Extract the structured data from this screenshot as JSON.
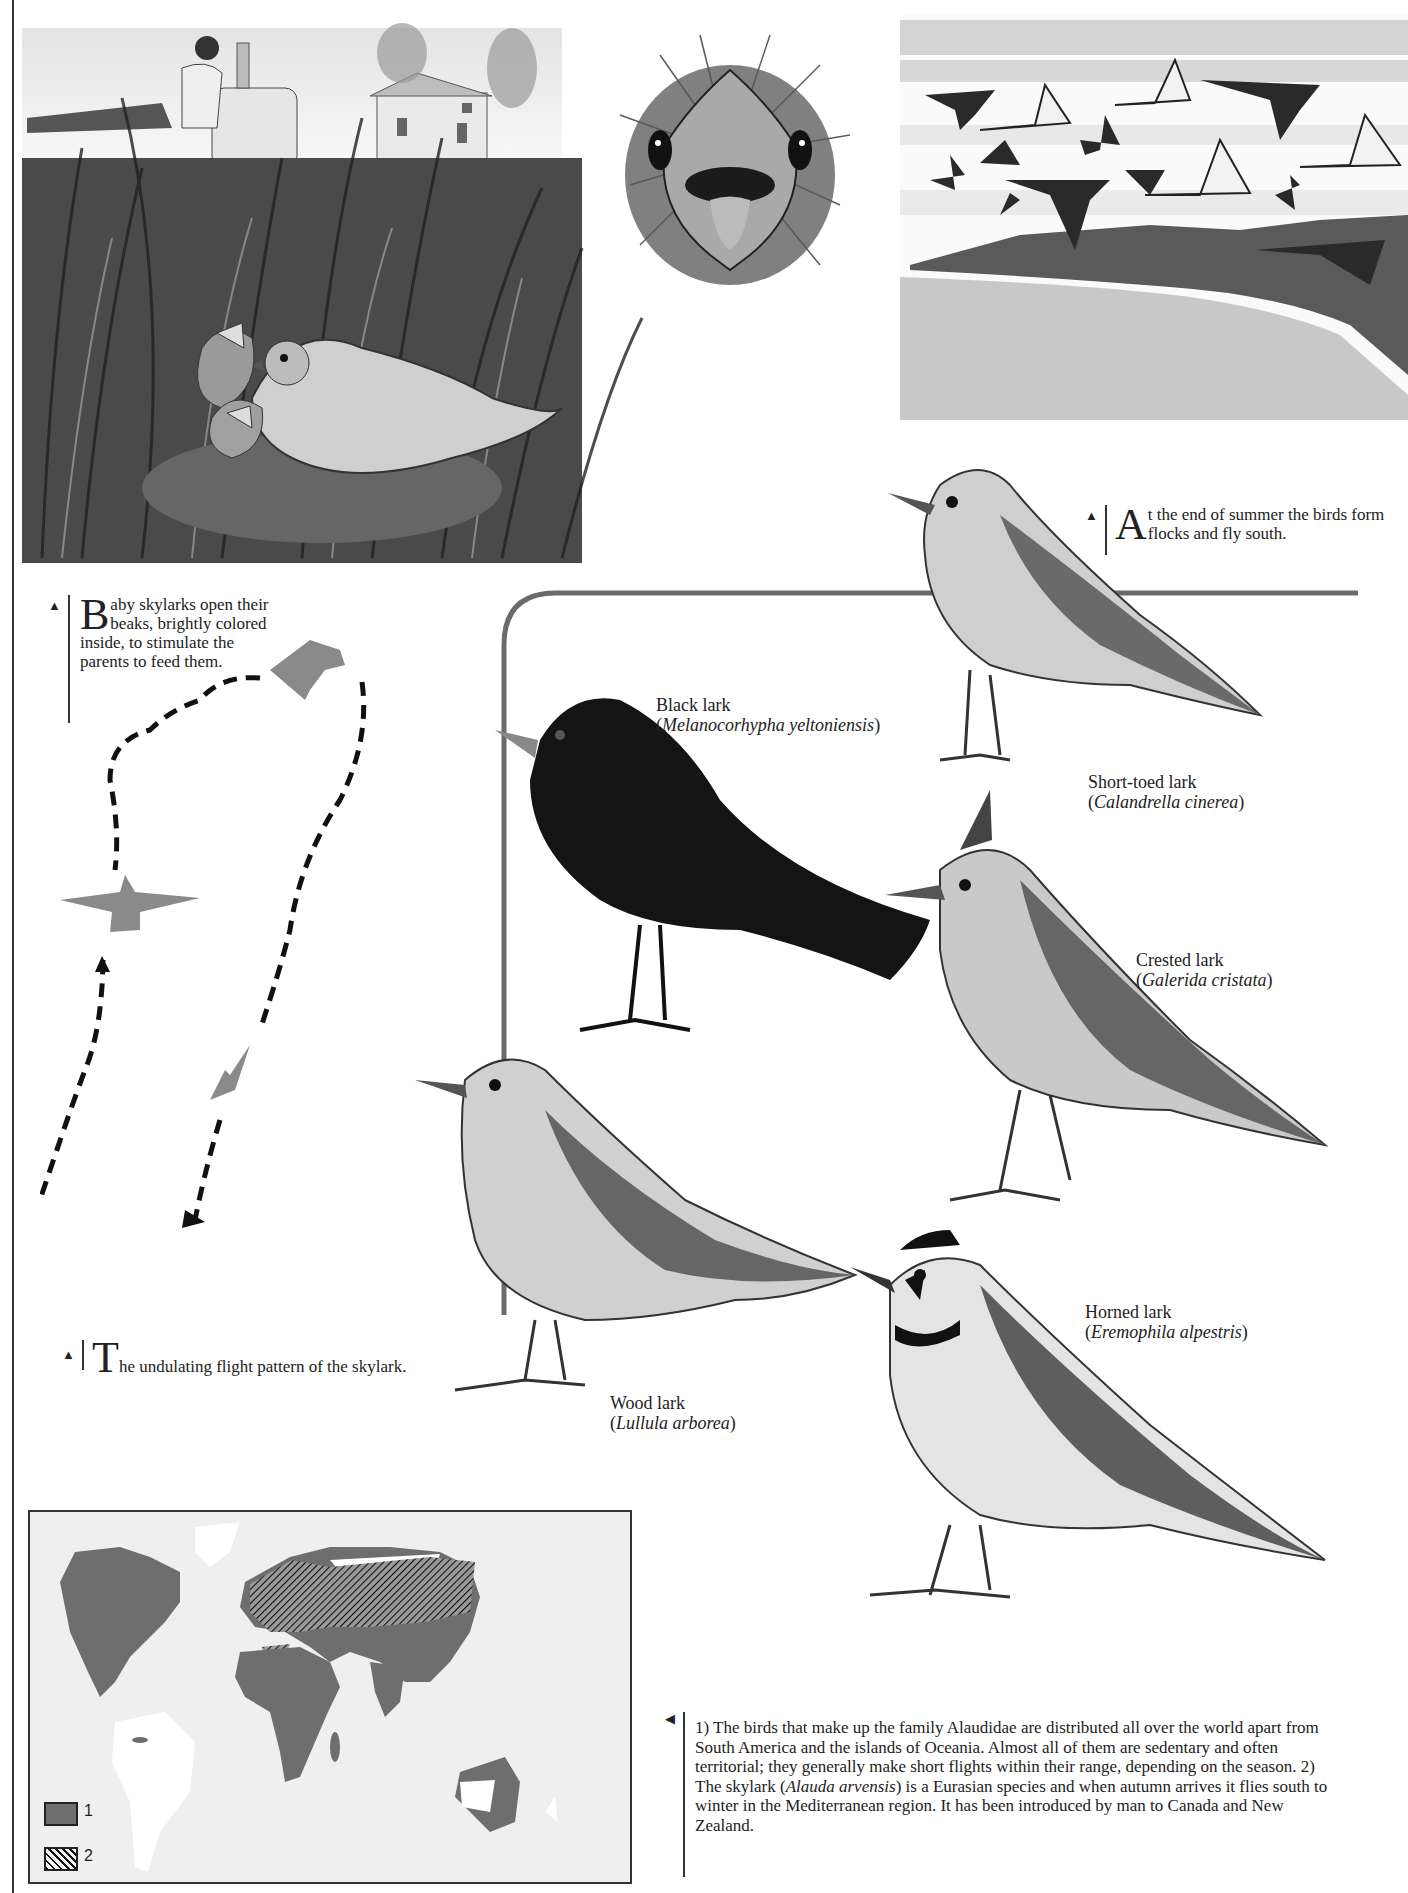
{
  "captions": {
    "flocks": {
      "marker": "▲",
      "dropcap": "A",
      "text": "t the end of summer the birds form flocks and fly south."
    },
    "baby_skylarks": {
      "marker": "▲",
      "dropcap": "B",
      "text": "aby skylarks open their beaks, brightly colored inside, to stimulate the parents to feed them."
    },
    "flight_pattern": {
      "marker": "▲",
      "dropcap": "T",
      "text": "he undulating flight pattern of the skylark."
    },
    "distribution": {
      "marker": "◀",
      "part1": "1) The birds that make up the family Alaudidae are distributed all over the world apart from South America and the islands of Oceania. Almost all of them are sedentary and often territorial; they generally make short flights within their range, depending on the season. 2) The skylark (",
      "italic": "Alauda arvensis",
      "part2": ") is a Eurasian species and when autumn arrives it flies south to winter in the Mediterranean region. It has been introduced by man to Canada and New Zealand."
    }
  },
  "species": [
    {
      "common": "Black lark",
      "scientific": "Melanocorhypha yeltoniensis"
    },
    {
      "common": "Short-toed lark",
      "scientific": "Calandrella cinerea"
    },
    {
      "common": "Crested lark",
      "scientific": "Galerida cristata"
    },
    {
      "common": "Wood lark",
      "scientific": "Lullula arborea"
    },
    {
      "common": "Horned lark",
      "scientific": "Eremophila alpestris"
    }
  ],
  "map": {
    "legend": [
      {
        "label": "1",
        "meaning": "Alaudidae family range",
        "swatch": "solid-gray"
      },
      {
        "label": "2",
        "meaning": "Skylark range",
        "swatch": "hatched"
      }
    ]
  },
  "colors": {
    "land": "#6e6e6e",
    "ocean": "#efefef",
    "unoccupied_land": "#ffffff",
    "silhouette": "#8a8a8a",
    "ink": "#1e1e1e"
  }
}
